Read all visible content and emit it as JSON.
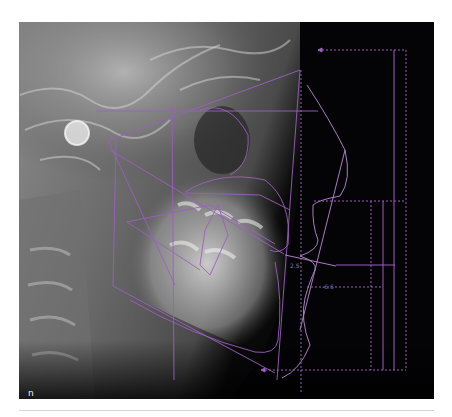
{
  "figure": {
    "panel_label": "n",
    "measurements": {
      "lip_value": "2.5",
      "chin_value": "-6.6"
    },
    "colors": {
      "tracing": "#9b5fc0",
      "tracing_light": "#b98ad6",
      "background_dark": "#050307",
      "divider": "#d6d6d6"
    }
  }
}
